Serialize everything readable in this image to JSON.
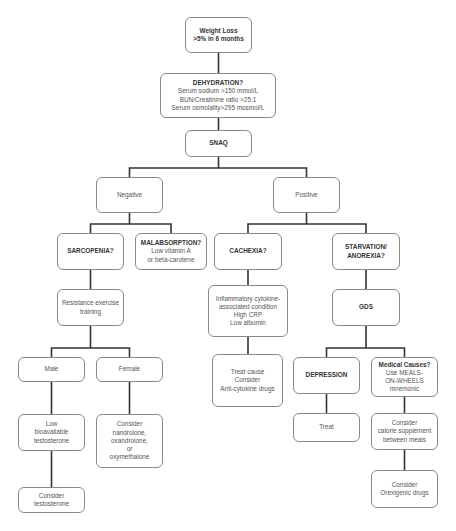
{
  "diagram": {
    "type": "flowchart",
    "nodes": {
      "weight_loss": {
        "lines": [
          "Weight Loss",
          ">5% in 6 months"
        ],
        "bold": true
      },
      "dehydration": {
        "title": "DEHYDRATION?",
        "lines": [
          "Serum sodium >150 mmol/L",
          "BUN/Creatinine ratio >25:1",
          "Serum osmolality>295 mosmol/L"
        ]
      },
      "snaq": {
        "lines": [
          "SNAQ"
        ],
        "bold": true
      },
      "negative": {
        "lines": [
          "Negative"
        ]
      },
      "positive": {
        "lines": [
          "Positive"
        ]
      },
      "sarcopenia": {
        "lines": [
          "SARCOPENIA?"
        ],
        "bold": true
      },
      "malabsorption": {
        "title": "MALABSORPTION?",
        "lines": [
          "Low vitamin A",
          "or beta-carotene"
        ]
      },
      "cachexia": {
        "lines": [
          "CACHEXIA?"
        ],
        "bold": true
      },
      "starvation": {
        "lines": [
          "STARVATION/",
          "ANOREXIA?"
        ],
        "bold": true
      },
      "resistance": {
        "lines": [
          "Resistance exercise",
          "training"
        ]
      },
      "inflammatory": {
        "lines": [
          "Inflammatory cytokine-",
          "associated condition",
          "High CRP",
          "Low albumin"
        ]
      },
      "gds": {
        "lines": [
          "GDS"
        ],
        "bold": true
      },
      "male": {
        "lines": [
          "Male"
        ]
      },
      "female": {
        "lines": [
          "Female"
        ]
      },
      "treat_cause": {
        "lines": [
          "Treat cause",
          "Consider",
          "Anti-cytokine drugs"
        ]
      },
      "depression": {
        "lines": [
          "DEPRESSION"
        ],
        "bold": true
      },
      "medical_causes": {
        "title": "Medical Causes?",
        "lines": [
          "Use MEALS-",
          "ON-WHEELS",
          "mnemonic"
        ]
      },
      "low_testosterone": {
        "lines": [
          "Low",
          "bioavailable",
          "testosterone"
        ]
      },
      "consider_nandrolone": {
        "lines": [
          "Consider",
          "nandrolone,",
          "oxandrolone,",
          "or",
          "oxymethalone"
        ]
      },
      "treat": {
        "lines": [
          "Treat"
        ]
      },
      "calorie_supplement": {
        "lines": [
          "Consider",
          "calorie supplement",
          "between meals"
        ]
      },
      "consider_testosterone": {
        "lines": [
          "Consider",
          "testosterone"
        ]
      },
      "orexigenic": {
        "lines": [
          "Consider",
          "Orexigenic drugs"
        ]
      }
    },
    "edges": [
      [
        "weight_loss",
        "dehydration"
      ],
      [
        "dehydration",
        "snaq"
      ],
      [
        "snaq",
        "negative"
      ],
      [
        "snaq",
        "positive"
      ],
      [
        "negative",
        "sarcopenia"
      ],
      [
        "negative",
        "malabsorption"
      ],
      [
        "positive",
        "cachexia"
      ],
      [
        "positive",
        "starvation"
      ],
      [
        "sarcopenia",
        "resistance"
      ],
      [
        "resistance",
        "male"
      ],
      [
        "resistance",
        "female"
      ],
      [
        "male",
        "low_testosterone"
      ],
      [
        "low_testosterone",
        "consider_testosterone"
      ],
      [
        "female",
        "consider_nandrolone"
      ],
      [
        "cachexia",
        "inflammatory"
      ],
      [
        "inflammatory",
        "treat_cause"
      ],
      [
        "starvation",
        "gds"
      ],
      [
        "gds",
        "depression"
      ],
      [
        "gds",
        "medical_causes"
      ],
      [
        "depression",
        "treat"
      ],
      [
        "medical_causes",
        "calorie_supplement"
      ],
      [
        "calorie_supplement",
        "orexigenic"
      ]
    ]
  }
}
